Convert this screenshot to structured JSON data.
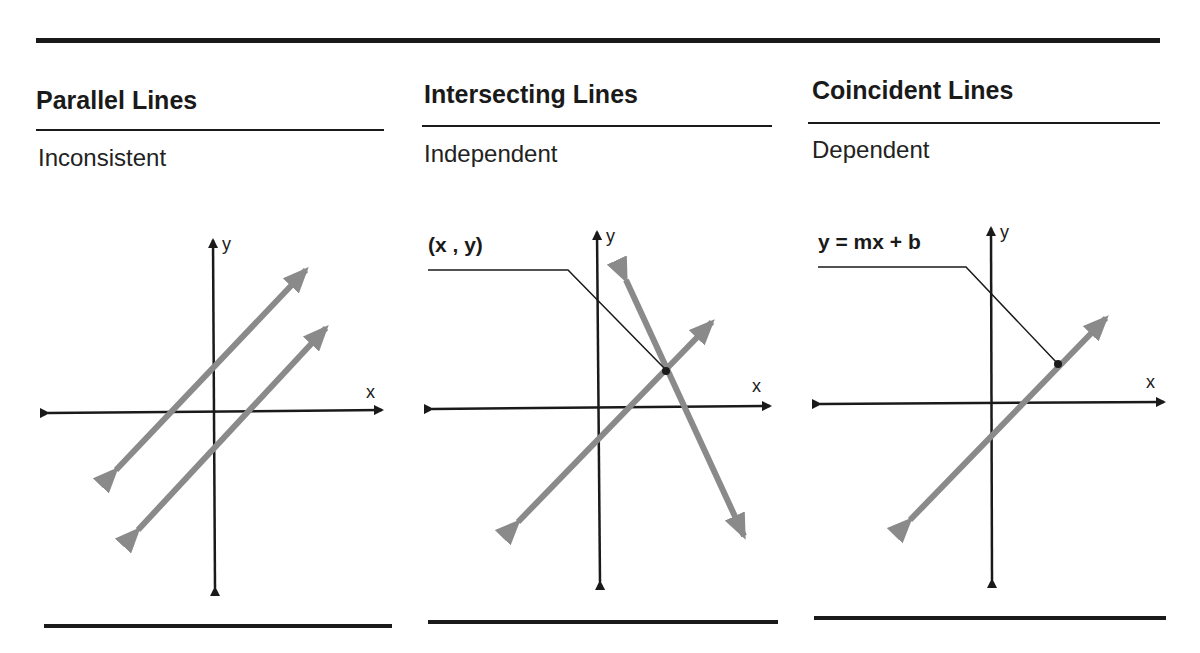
{
  "panels": [
    {
      "title": "Parallel Lines",
      "subtitle": "Inconsistent",
      "x_axis_label": "x",
      "y_axis_label": "y"
    },
    {
      "title": "Intersecting Lines",
      "subtitle": "Independent",
      "x_axis_label": "x",
      "y_axis_label": "y",
      "callout": "(x , y)"
    },
    {
      "title": "Coincident Lines",
      "subtitle": "Dependent",
      "x_axis_label": "x",
      "y_axis_label": "y",
      "callout": "y = mx + b"
    }
  ],
  "colors": {
    "axis": "#1a1a1a",
    "line": "#8a8a8a",
    "rule": "#1a1a1a"
  }
}
